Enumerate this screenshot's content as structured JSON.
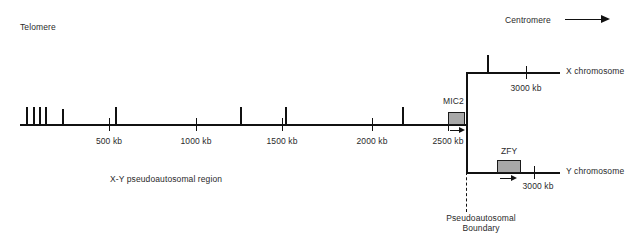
{
  "figure": {
    "type": "genetic-map-diagram",
    "background": "#ffffff",
    "line_color": "#111111",
    "box_fill": "#a8a8a8",
    "box_stroke": "#1a1a1a"
  },
  "annotations": {
    "telomere": "Telomere",
    "centromere": "Centromere",
    "region_label": "X-Y pseudoautosomal region",
    "boundary_line1": "Pseudoautosomal",
    "boundary_line2": "Boundary"
  },
  "main_axis": {
    "scale_ticks": [
      {
        "label": "500 kb",
        "x": 109
      },
      {
        "label": "1000 kb",
        "x": 196
      },
      {
        "label": "1500 kb",
        "x": 282
      },
      {
        "label": "2000 kb",
        "x": 372
      },
      {
        "label": "2500 kb",
        "x": 448
      }
    ],
    "marker_ticks_x": [
      26,
      33,
      39,
      45,
      62,
      115,
      240,
      285,
      402
    ],
    "start_x": 20,
    "end_x": 467,
    "y": 124
  },
  "genes": [
    {
      "name": "MIC2",
      "on": "main-axis",
      "box_x": 448,
      "box_w": 17,
      "box_h": 13,
      "arrow_x": 450,
      "arrow_w": 15
    },
    {
      "name": "ZFY",
      "on": "y-chromosome",
      "box_x": 497,
      "box_w": 24,
      "box_h": 13,
      "arrow_x": 500,
      "arrow_w": 17
    }
  ],
  "branches": [
    {
      "id": "x-chromosome",
      "label": "X chromosome",
      "y": 72,
      "start_x": 467,
      "end_x": 560,
      "scale_tick": {
        "label": "3000 kb",
        "x": 526
      },
      "marker_ticks_x": [
        487
      ]
    },
    {
      "id": "y-chromosome",
      "label": "Y chromosome",
      "y": 172,
      "start_x": 467,
      "end_x": 560,
      "scale_tick": {
        "label": "3000 kb",
        "x": 534
      },
      "marker_ticks_x": []
    }
  ]
}
